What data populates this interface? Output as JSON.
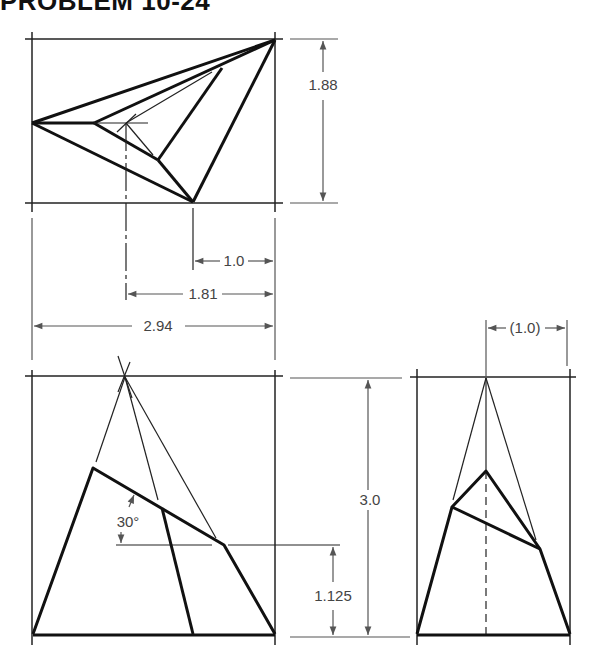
{
  "title": "PROBLEM 10-24",
  "colors": {
    "object_line": "#111111",
    "construction_line": "#222222",
    "dimension": "#555555",
    "background": "#ffffff"
  },
  "views": {
    "top": {
      "name": "Top view",
      "dimensions": {
        "height": "1.88",
        "offset_small": "1.0",
        "offset_mid": "1.81",
        "width": "2.94"
      }
    },
    "front": {
      "name": "Front view",
      "dimensions": {
        "height": "3.0",
        "cut_height": "1.125",
        "angle": "30°"
      }
    },
    "side": {
      "name": "Side view",
      "dimensions": {
        "offset": "(1.0)"
      }
    }
  }
}
